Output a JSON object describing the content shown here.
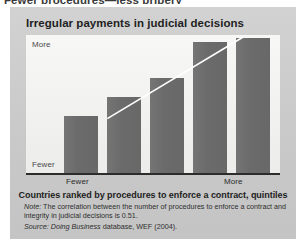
{
  "page_heading": "Fewer procedures—less bribery",
  "figure": {
    "title": "Irregular payments in judicial decisions",
    "y_axis": {
      "top_label": "More",
      "bottom_label": "Fewer"
    },
    "x_axis": {
      "left_label": "Fewer",
      "right_label": "More",
      "title": "Countries ranked by procedures to enforce a contract, quintiles"
    },
    "note": {
      "lead": "Note:",
      "text": " The correlation between the number of procedures to enforce a contract and integrity in judicial decisions is 0.51."
    },
    "source": {
      "lead": "Source:",
      "database": " Doing Business",
      "rest": " database, WEF (2004)."
    },
    "colors": {
      "panel": "#cdcdcd",
      "plot": "#f4f4f2",
      "bar": "#6f6f6f",
      "axis": "#2c2c2c",
      "trendline": "#ffffff"
    }
  },
  "chart_data": {
    "type": "bar",
    "title": "Irregular payments in judicial decisions",
    "xlabel": "Countries ranked by procedures to enforce a contract, quintiles",
    "ylabel": "",
    "categories": [
      "1",
      "2",
      "3",
      "4",
      "5"
    ],
    "x_tick_labels": [
      "Fewer",
      "",
      "",
      "",
      "More"
    ],
    "y_tick_labels": [
      "Fewer",
      "More"
    ],
    "values": [
      42,
      56,
      70,
      96,
      99
    ],
    "ylim": [
      0,
      100
    ],
    "grid": false,
    "legend": "none",
    "annotations": [
      {
        "type": "trendline",
        "from": [
          0.55,
          40
        ],
        "to": [
          3.85,
          100
        ],
        "color": "#ffffff"
      }
    ],
    "series": [
      {
        "name": "Irregular payments in judicial decisions",
        "values": [
          42,
          56,
          70,
          96,
          99
        ]
      }
    ]
  }
}
